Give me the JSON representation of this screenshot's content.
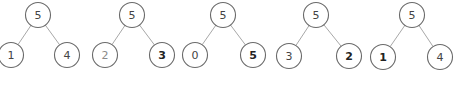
{
  "diagram": {
    "type": "binary-trees",
    "node_radius": 12.5,
    "trees": [
      {
        "id": "tree-1",
        "root": {
          "label": "5",
          "x": 38,
          "y": 15,
          "style": "normal"
        },
        "left": {
          "label": "1",
          "x": 11,
          "y": 55,
          "style": "normal"
        },
        "right": {
          "label": "4",
          "x": 67,
          "y": 55,
          "style": "normal"
        }
      },
      {
        "id": "tree-2",
        "root": {
          "label": "5",
          "x": 132,
          "y": 15,
          "style": "normal"
        },
        "left": {
          "label": "2",
          "x": 105,
          "y": 55,
          "style": "light"
        },
        "right": {
          "label": "3",
          "x": 162,
          "y": 55,
          "style": "bold"
        }
      },
      {
        "id": "tree-3",
        "root": {
          "label": "5",
          "x": 223,
          "y": 15,
          "style": "normal"
        },
        "left": {
          "label": "0",
          "x": 195,
          "y": 55,
          "style": "normal"
        },
        "right": {
          "label": "5",
          "x": 253,
          "y": 55,
          "style": "bold"
        }
      },
      {
        "id": "tree-4",
        "root": {
          "label": "5",
          "x": 316,
          "y": 15,
          "style": "normal"
        },
        "left": {
          "label": "3",
          "x": 289,
          "y": 56,
          "style": "normal"
        },
        "right": {
          "label": "2",
          "x": 349,
          "y": 56,
          "style": "bold"
        }
      },
      {
        "id": "tree-5",
        "root": {
          "label": "5",
          "x": 412,
          "y": 15,
          "style": "normal"
        },
        "left": {
          "label": "1",
          "x": 383,
          "y": 57,
          "style": "bold"
        },
        "right": {
          "label": "4",
          "x": 440,
          "y": 57,
          "style": "normal"
        }
      }
    ]
  }
}
